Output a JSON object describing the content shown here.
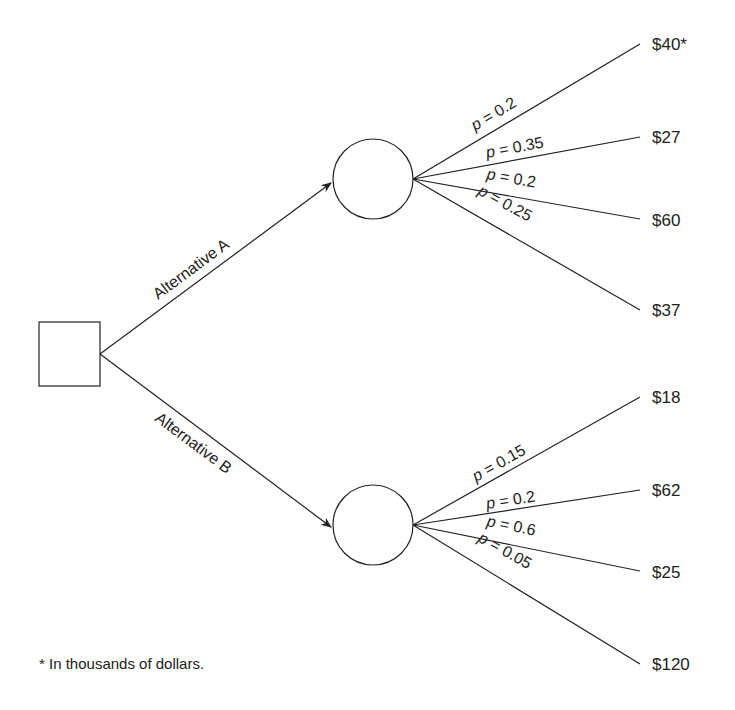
{
  "diagram": {
    "type": "decision-tree",
    "decision_node": {
      "shape": "square"
    },
    "alternatives": [
      {
        "label": "Alternative A",
        "chance_node": {
          "shape": "circle"
        },
        "outcomes": [
          {
            "p_symbol": "p",
            "p_value": "= 0.2",
            "payoff": "$40*"
          },
          {
            "p_symbol": "p",
            "p_value": "= 0.35",
            "payoff": "$27"
          },
          {
            "p_symbol": "p",
            "p_value": "= 0.2",
            "payoff": "$60"
          },
          {
            "p_symbol": "p",
            "p_value": "= 0.25",
            "payoff": "$37"
          }
        ]
      },
      {
        "label": "Alternative B",
        "chance_node": {
          "shape": "circle"
        },
        "outcomes": [
          {
            "p_symbol": "p",
            "p_value": "= 0.15",
            "payoff": "$18"
          },
          {
            "p_symbol": "p",
            "p_value": "= 0.2",
            "payoff": "$62"
          },
          {
            "p_symbol": "p",
            "p_value": "= 0.6",
            "payoff": "$25"
          },
          {
            "p_symbol": "p",
            "p_value": "= 0.05",
            "payoff": "$120"
          }
        ]
      }
    ],
    "footnote": "* In thousands of dollars.",
    "colors": {
      "stroke": "#222222",
      "background": "#ffffff"
    }
  }
}
